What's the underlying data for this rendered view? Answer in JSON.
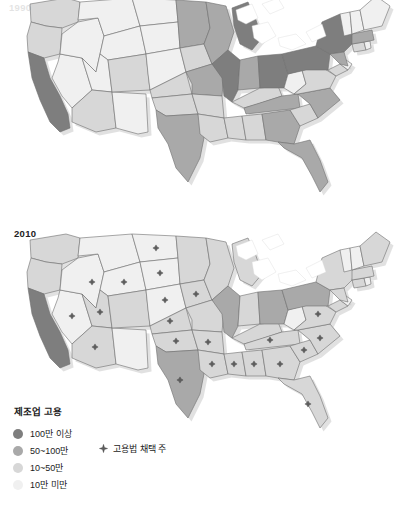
{
  "figure": {
    "name": "us-manufacturing-employment-choropleth-pair",
    "top_panel_year": "1990",
    "bottom_panel_year": "2010"
  },
  "legend": {
    "title": "제조업 고용",
    "classes": [
      {
        "label": "100만 이상",
        "color": "#7e7e7e"
      },
      {
        "label": "50~100만",
        "color": "#a9a9a9"
      },
      {
        "label": "10~50만",
        "color": "#d7d7d7"
      },
      {
        "label": "10만 미만",
        "color": "#f0f0f0"
      }
    ],
    "marker": {
      "label": "고용법 채택 주",
      "symbol": "diamond-marker",
      "color": "#5d5d5d"
    }
  },
  "chart_data": {
    "type": "choropleth",
    "title": "제조업 고용",
    "panels": [
      {
        "year": "1990",
        "label": "",
        "states": {
          "WA": 2,
          "OR": 2,
          "CA": 0,
          "NV": 3,
          "ID": 3,
          "MT": 3,
          "WY": 3,
          "UT": 3,
          "AZ": 2,
          "NM": 3,
          "CO": 2,
          "ND": 3,
          "SD": 3,
          "NE": 3,
          "KS": 2,
          "OK": 2,
          "TX": 1,
          "MN": 1,
          "IA": 2,
          "MO": 1,
          "AR": 2,
          "LA": 2,
          "WI": 1,
          "IL": 0,
          "MS": 2,
          "AL": 2,
          "MI": 0,
          "IN": 1,
          "KY": 2,
          "TN": 1,
          "OH": 0,
          "WV": 3,
          "GA": 1,
          "FL": 1,
          "SC": 2,
          "NC": 1,
          "VA": 2,
          "PA": 0,
          "NY": 0,
          "MD": 2,
          "DE": 3,
          "NJ": 1,
          "CT": 2,
          "RI": 3,
          "MA": 1,
          "VT": 3,
          "NH": 3,
          "ME": 3
        },
        "right_to_work_states": []
      },
      {
        "year": "2010",
        "label": "2010",
        "states": {
          "WA": 2,
          "OR": 2,
          "CA": 0,
          "NV": 3,
          "ID": 3,
          "MT": 3,
          "WY": 3,
          "UT": 2,
          "AZ": 2,
          "NM": 3,
          "CO": 2,
          "ND": 3,
          "SD": 3,
          "NE": 3,
          "KS": 2,
          "OK": 2,
          "TX": 1,
          "MN": 2,
          "IA": 2,
          "MO": 2,
          "AR": 2,
          "LA": 2,
          "WI": 2,
          "IL": 1,
          "MS": 2,
          "AL": 2,
          "MI": 2,
          "IN": 2,
          "KY": 2,
          "TN": 2,
          "OH": 1,
          "WV": 3,
          "GA": 2,
          "FL": 2,
          "SC": 2,
          "NC": 2,
          "VA": 2,
          "PA": 1,
          "NY": 2,
          "MD": 2,
          "DE": 3,
          "NJ": 2,
          "CT": 2,
          "RI": 3,
          "MA": 2,
          "VT": 3,
          "NH": 3,
          "ME": 2
        },
        "right_to_work_states": [
          "ID",
          "NV",
          "UT",
          "AZ",
          "WY",
          "ND",
          "SD",
          "NE",
          "KS",
          "OK",
          "TX",
          "IA",
          "AR",
          "LA",
          "MS",
          "AL",
          "TN",
          "GA",
          "FL",
          "SC",
          "NC",
          "VA"
        ]
      }
    ]
  }
}
